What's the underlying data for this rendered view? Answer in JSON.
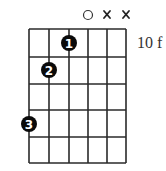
{
  "chord_diagram": {
    "strings": 6,
    "frets_shown": 5,
    "start_fret_label": "10 f",
    "string_markers": [
      {
        "string": 4,
        "marker": "open",
        "symbol": "○"
      },
      {
        "string": 5,
        "marker": "muted",
        "symbol": "x"
      },
      {
        "string": 6,
        "marker": "muted",
        "symbol": "x"
      }
    ],
    "fingers": [
      {
        "finger": "1",
        "string": 3,
        "fret": 1
      },
      {
        "finger": "2",
        "string": 2,
        "fret": 2
      },
      {
        "finger": "3",
        "string": 1,
        "fret": 4
      }
    ],
    "colors": {
      "grid": "#2a2a2a",
      "dot": "#0a0a0a",
      "dot_text": "#ffffff",
      "background": "#ffffff"
    }
  }
}
